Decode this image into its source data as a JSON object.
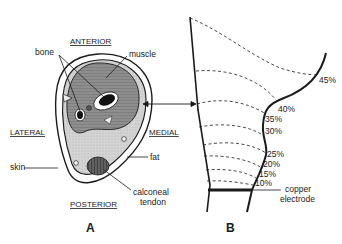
{
  "panel_a": {
    "letter": "A",
    "orientation": {
      "anterior": "ANTERIOR",
      "posterior": "POSTERIOR",
      "lateral": "LATERAL",
      "medial": "MEDIAL"
    },
    "labels": {
      "bone": "bone",
      "muscle": "muscle",
      "skin": "skin",
      "fat": "fat",
      "tendon_line1": "calconeal",
      "tendon_line2": "tendon"
    }
  },
  "panel_b": {
    "letter": "B",
    "percent_labels": [
      "45%",
      "40%",
      "35%",
      "30%",
      "25%",
      "20%",
      "15%",
      "10%"
    ],
    "electrode_line1": "copper",
    "electrode_line2": "electrode"
  },
  "colors": {
    "ink": "#1a1a1a",
    "muscle": "#8a8a8a",
    "fat": "#cfcfcf",
    "bone": "#111111",
    "tendon": "#555555"
  }
}
